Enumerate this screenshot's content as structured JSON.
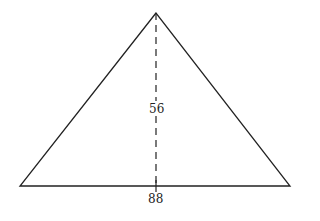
{
  "diagram": {
    "shape": "triangle",
    "apex": [
      156,
      13
    ],
    "base_left": [
      20,
      186
    ],
    "base_right": [
      290,
      186
    ],
    "height_label": "56",
    "base_label": "88",
    "line_color": "#222222"
  }
}
